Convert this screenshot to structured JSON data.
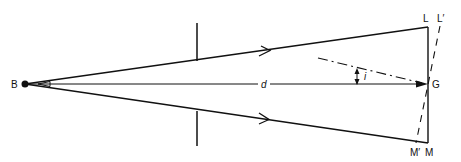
{
  "diagram": {
    "type": "optics ray diagram",
    "labels": {
      "source": "B",
      "top_end": "L",
      "top_end_tilted": "L′",
      "center": "G",
      "bottom_end": "M",
      "bottom_end_tilted": "M′",
      "distance": "d",
      "angle": "i"
    },
    "colors": {
      "stroke": "#111111",
      "background": "#ffffff"
    }
  }
}
